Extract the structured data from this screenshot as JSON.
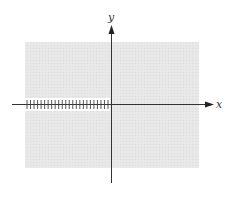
{
  "diagram": {
    "type": "complex-plane-branch-cut",
    "axes": {
      "x_label": "x",
      "y_label": "y"
    },
    "region": {
      "fill": "#e6e6e6",
      "description": "shaded plane region"
    },
    "branch_cut": {
      "location": "negative real axis",
      "tick_count": 24,
      "color": "#444444"
    },
    "colors": {
      "axis": "#333333",
      "background": "#ffffff"
    }
  }
}
